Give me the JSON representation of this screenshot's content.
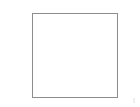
{
  "canvas": {
    "width_px": 140,
    "height_px": 107,
    "background_color": "#ffffff"
  },
  "shapes": {
    "outline_box": {
      "name": "empty-square-outline",
      "label": "",
      "x_px": 32,
      "y_px": 13,
      "width_px": 86,
      "height_px": 85,
      "border_color": "#8d8d8d",
      "border_width_px": 1,
      "fill_color": "#ffffff",
      "content_text": ""
    }
  },
  "artifacts": {
    "bottom_right_mark": {
      "name": "faint-corner-artifact",
      "x_px": 133,
      "y_px": 98,
      "width_px": 2,
      "height_px": 5,
      "color": "#efefef"
    }
  }
}
